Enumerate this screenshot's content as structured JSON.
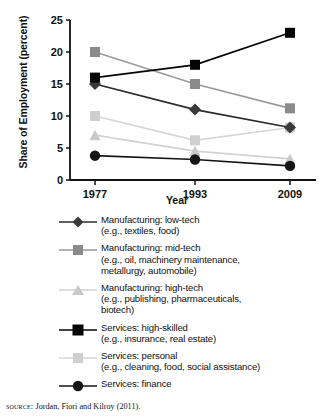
{
  "chart_data": {
    "type": "line",
    "title": "",
    "xlabel": "Year",
    "ylabel": "Share of Employment (percent)",
    "categories": [
      "1977",
      "1993",
      "2009"
    ],
    "x": [
      1977,
      1993,
      2009
    ],
    "ylim": [
      0,
      25
    ],
    "yticks": [
      "0",
      "5",
      "10",
      "15",
      "20",
      "25"
    ],
    "ytick_values": [
      0,
      5,
      10,
      15,
      20,
      25
    ],
    "grid": false,
    "legend_position": "below",
    "series": [
      {
        "name": "Manufacturing: low-tech",
        "detail": "(e.g., textiles, food)",
        "marker": "diamond",
        "color": "#3a3a3a",
        "line_color": "#2b2b2b",
        "values": [
          15,
          11,
          8.2
        ]
      },
      {
        "name": "Manufacturing: mid-tech",
        "detail": "(e.g., oil, machinery maintenance, metallurgy, automobile)",
        "marker": "square",
        "color": "#8a8a8a",
        "line_color": "#9a9a9a",
        "values": [
          20,
          15,
          11.2
        ]
      },
      {
        "name": "Manufacturing: high-tech",
        "detail": "(e.g., publishing, pharmaceuticals, biotech)",
        "marker": "triangle",
        "color": "#c9c9c9",
        "line_color": "#d2d2d2",
        "values": [
          7,
          4.5,
          3.3
        ]
      },
      {
        "name": "Services: high-skilled",
        "detail": "(e.g., insurance, real estate)",
        "marker": "square",
        "color": "#050505",
        "line_color": "#050505",
        "values": [
          16,
          18,
          23
        ]
      },
      {
        "name": "Services: personal",
        "detail": "(e.g., cleaning, food, social assistance)",
        "marker": "square",
        "color": "#cfcfcf",
        "line_color": "#d6d6d6",
        "values": [
          10,
          6.2,
          8.2
        ]
      },
      {
        "name": "Services: finance",
        "detail": "",
        "marker": "circle",
        "color": "#151515",
        "line_color": "#151515",
        "values": [
          3.8,
          3.2,
          2.2
        ]
      }
    ]
  },
  "axis": {
    "y_title": "Share of Employment (percent)",
    "x_title": "Year"
  },
  "legend": [
    {
      "marker": "diamond-marker",
      "line1": "Manufacturing: low-tech",
      "line2": "(e.g., textiles, food)",
      "line3": ""
    },
    {
      "marker": "square-marker",
      "line1": "Manufacturing: mid-tech",
      "line2": "(e.g., oil, machinery maintenance,",
      "line3": "metallurgy, automobile)"
    },
    {
      "marker": "triangle-marker",
      "line1": "Manufacturing: high-tech",
      "line2": "(e.g., publishing, pharmaceuticals,",
      "line3": "biotech)"
    },
    {
      "marker": "square-marker",
      "line1": "Services: high-skilled",
      "line2": "(e.g., insurance, real estate)",
      "line3": ""
    },
    {
      "marker": "square-marker",
      "line1": "Services: personal",
      "line2": "(e.g., cleaning, food, social assistance)",
      "line3": ""
    },
    {
      "marker": "circle-marker",
      "line1": "Services: finance",
      "line2": "",
      "line3": ""
    }
  ],
  "source": {
    "keyword": "source:",
    "text": " Jordan, Fiori and Kilroy (2011)."
  }
}
